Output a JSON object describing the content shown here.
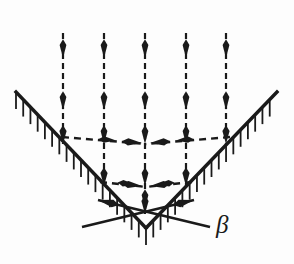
{
  "figure": {
    "title": "",
    "background_color": "#fdfdfd",
    "ink_color": "#1a1a1a",
    "width": 294,
    "height": 264
  },
  "labels": {
    "beta": {
      "text": "β",
      "x": 216,
      "y": 212,
      "font_size": 25,
      "style": "italic"
    }
  },
  "geometry": {
    "wedge": {
      "name": "v-shaped-wedge-surface",
      "left_end": {
        "x": 16,
        "y": 92
      },
      "vertex": {
        "x": 146,
        "y": 228
      },
      "right_end": {
        "x": 277,
        "y": 92
      },
      "stroke_width": 3.4,
      "hatch": {
        "length": 17,
        "spacing": 10.4,
        "stroke_width": 1.8,
        "direction": "vertical-down"
      }
    },
    "angle_marker": {
      "name": "beta-angle-indicator",
      "left_arm": {
        "x1": 210,
        "y1": 227,
        "x2": 98,
        "y2": 200
      },
      "right_arm": {
        "x1": 82,
        "y1": 227,
        "x2": 194,
        "y2": 200
      },
      "stroke_width": 2.6,
      "arrowheads": "inward"
    },
    "vertical_rays": {
      "name": "incident-flow-arrows",
      "count": 5,
      "x_positions": [
        63,
        104,
        145,
        186,
        226
      ],
      "y_start": 33,
      "y_end": [
        144,
        186,
        214,
        186,
        144
      ],
      "dash": "6 4",
      "stroke_width": 2.2,
      "arrow_rows_y": [
        58,
        110,
        144,
        186,
        208
      ]
    },
    "horizontal_rays": {
      "name": "lateral-flow-arrows",
      "upper": {
        "y": 144,
        "left_from": {
          "x": 62,
          "y": 137
        },
        "left_to": {
          "x": 146,
          "y": 144
        },
        "right_from": {
          "x": 230,
          "y": 137
        },
        "right_to": {
          "x": 146,
          "y": 144
        }
      },
      "lower": {
        "y": 186,
        "left_from": {
          "x": 100,
          "y": 182
        },
        "left_to": {
          "x": 146,
          "y": 187
        },
        "right_from": {
          "x": 192,
          "y": 182
        },
        "right_to": {
          "x": 146,
          "y": 187
        }
      },
      "dash": "7 5",
      "stroke_width": 2.4
    }
  }
}
